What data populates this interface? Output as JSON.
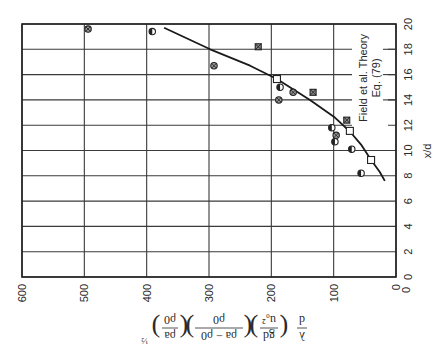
{
  "chart_data": {
    "type": "scatter",
    "orientation_note": "figure printed rotated 90 degrees",
    "title": "",
    "xlabel": "x/d",
    "ylabel": "λ/d (gd/u₀²) ((ρa − ρ0)/ρ0) (ρa/ρ0)^½",
    "xlim": [
      0,
      20
    ],
    "ylim": [
      0,
      600
    ],
    "x_ticks": [
      "0",
      "2",
      "4",
      "6",
      "8",
      "10",
      "12",
      "14",
      "16",
      "18",
      "20"
    ],
    "y_ticks": [
      "0",
      "100",
      "200",
      "300",
      "400",
      "500",
      "600"
    ],
    "grid": true,
    "annotation": [
      "Field et al. Theory",
      "Eq. (79)"
    ],
    "series": [
      {
        "name": "Field et al. Theory Eq. (79)",
        "kind": "line",
        "points": [
          [
            19.7,
            372
          ],
          [
            18.0,
            298
          ],
          [
            16.7,
            234
          ],
          [
            15.65,
            191
          ],
          [
            14.0,
            138
          ],
          [
            12.6,
            98
          ],
          [
            11.5,
            74
          ],
          [
            10.4,
            55
          ],
          [
            9.25,
            40
          ],
          [
            8.3,
            26
          ],
          [
            7.6,
            18
          ]
        ]
      },
      {
        "name": "Theory points (open squares)",
        "kind": "marker-open-square",
        "points": [
          [
            15.65,
            191
          ],
          [
            11.55,
            74
          ],
          [
            9.25,
            40
          ]
        ]
      },
      {
        "name": "Data (crossed circles)",
        "kind": "marker-crossed-circle",
        "points": [
          [
            19.6,
            494
          ],
          [
            16.7,
            292
          ],
          [
            14.6,
            165
          ],
          [
            14.0,
            188
          ],
          [
            11.2,
            96
          ]
        ]
      },
      {
        "name": "Data (half-filled circles)",
        "kind": "marker-half-circle",
        "points": [
          [
            19.4,
            391
          ],
          [
            15.0,
            186
          ],
          [
            11.8,
            103
          ],
          [
            10.7,
            98
          ],
          [
            10.1,
            71
          ],
          [
            8.2,
            56
          ]
        ]
      },
      {
        "name": "Data (crossed squares)",
        "kind": "marker-crossed-square",
        "points": [
          [
            18.2,
            221
          ],
          [
            14.6,
            133
          ],
          [
            12.4,
            79
          ]
        ]
      }
    ]
  },
  "labels": {
    "xlabel": "x/d",
    "annotation_line1": "Field et al. Theory",
    "annotation_line2": "Eq. (79)",
    "ylabel_lambda": "λ",
    "ylabel_d": "d",
    "ylabel_gd": "gd",
    "ylabel_u0sq": "u₀²",
    "ylabel_rho_diff": "ρa − ρ0",
    "ylabel_rho0": "ρ0",
    "ylabel_rhoa": "ρa",
    "ylabel_exp": "½"
  }
}
